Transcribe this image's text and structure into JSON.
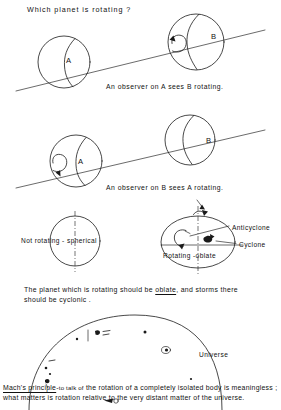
{
  "figure": {
    "title_question": "Which planet is rotating ?",
    "panels": [
      {
        "id": "panel-a-sees-b",
        "caption": "An observer on A sees B rotating.",
        "left_sphere_label": "A",
        "right_sphere_label": "B",
        "rotating_sphere": "B"
      },
      {
        "id": "panel-b-sees-a",
        "caption": "An observer on B sees A rotating.",
        "left_sphere_label": "A",
        "right_sphere_label": "B",
        "rotating_sphere": "A"
      }
    ],
    "shape_panel": {
      "not_rotating_label": "Not rotating - spherical",
      "rotating_label": "Rotating -oblate",
      "anticyclone_label": "Anticyclone",
      "cyclone_label": "Cyclone"
    },
    "conclusion": {
      "part1": "The planet which is rotating should be ",
      "emphasis": "oblate",
      "part2": ", and storms there should be cyclonic ."
    },
    "universe_panel": {
      "label": "Universe"
    },
    "mach": {
      "term": "Mach's principle",
      "dash": "-",
      "line1_small": "to talk of",
      "line1_rest": "the rotation of a completely isolated body",
      "line2": "is meaningless ; what matters is",
      "line2_rest": "rotation relative to the very distant",
      "line3": "matter of the universe."
    },
    "colors": {
      "ink": "#1a1a1a",
      "paper": "#ffffff"
    }
  }
}
